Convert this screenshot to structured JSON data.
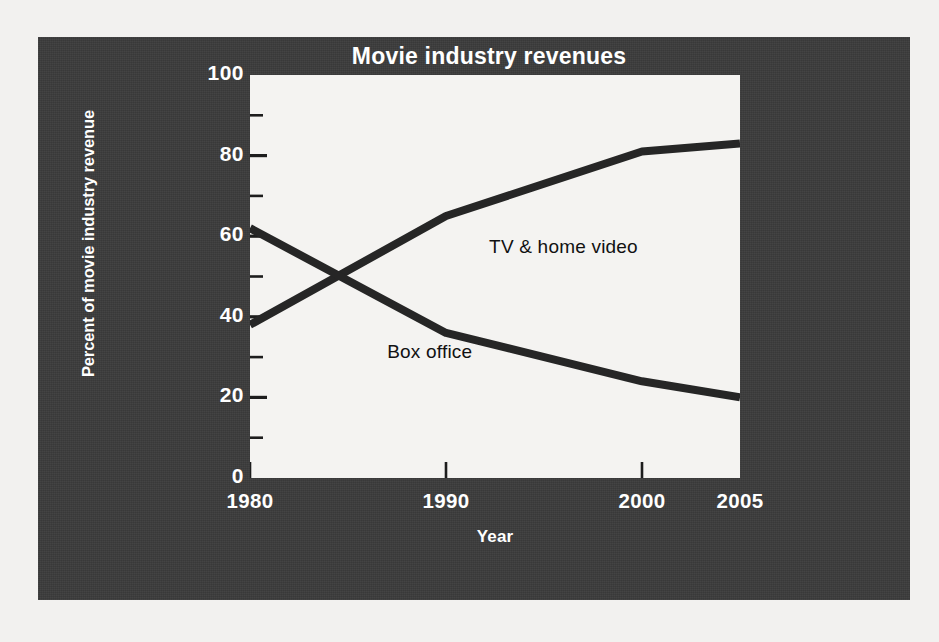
{
  "figure": {
    "panel_bg": "#3b3b3b",
    "plot_bg": "#f4f3f1",
    "line_color": "#262626",
    "text_color": "#ffffff"
  },
  "chart_data": {
    "type": "line",
    "title": "Movie industry revenues",
    "xlabel": "Year",
    "ylabel": "Percent of movie industry revenue",
    "xlim": [
      1980,
      2005
    ],
    "ylim": [
      0,
      100
    ],
    "xticks": [
      "1980",
      "1990",
      "2000",
      "2005"
    ],
    "xtick_values": [
      1980,
      1990,
      2000,
      2005
    ],
    "yticks": [
      "0",
      "20",
      "40",
      "60",
      "80",
      "100"
    ],
    "ytick_values": [
      0,
      20,
      40,
      60,
      80,
      100
    ],
    "yminor_values": [
      10,
      30,
      50,
      70,
      90
    ],
    "grid": false,
    "legend": "inline-labels",
    "x": [
      1980,
      1990,
      2000,
      2005
    ],
    "series": [
      {
        "name": "TV & home video",
        "values": [
          38,
          65,
          81,
          83
        ],
        "label_x": 1992.2,
        "label_y": 57
      },
      {
        "name": "Box office",
        "values": [
          62,
          36,
          24,
          20
        ],
        "label_x": 1987.0,
        "label_y": 31
      }
    ],
    "annotations": [
      "Lines cross at approximately 1984 at 50 percent"
    ]
  }
}
